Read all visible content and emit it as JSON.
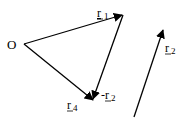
{
  "diagram": {
    "origin_label": "O",
    "vectors": [
      {
        "id": "r1",
        "label": "r",
        "subscript": "1",
        "prefix": ""
      },
      {
        "id": "neg-r2",
        "label": "r",
        "subscript": "2",
        "prefix": "-"
      },
      {
        "id": "r4",
        "label": "r",
        "subscript": "4",
        "prefix": ""
      },
      {
        "id": "r2",
        "label": "r",
        "subscript": "2",
        "prefix": ""
      }
    ]
  }
}
